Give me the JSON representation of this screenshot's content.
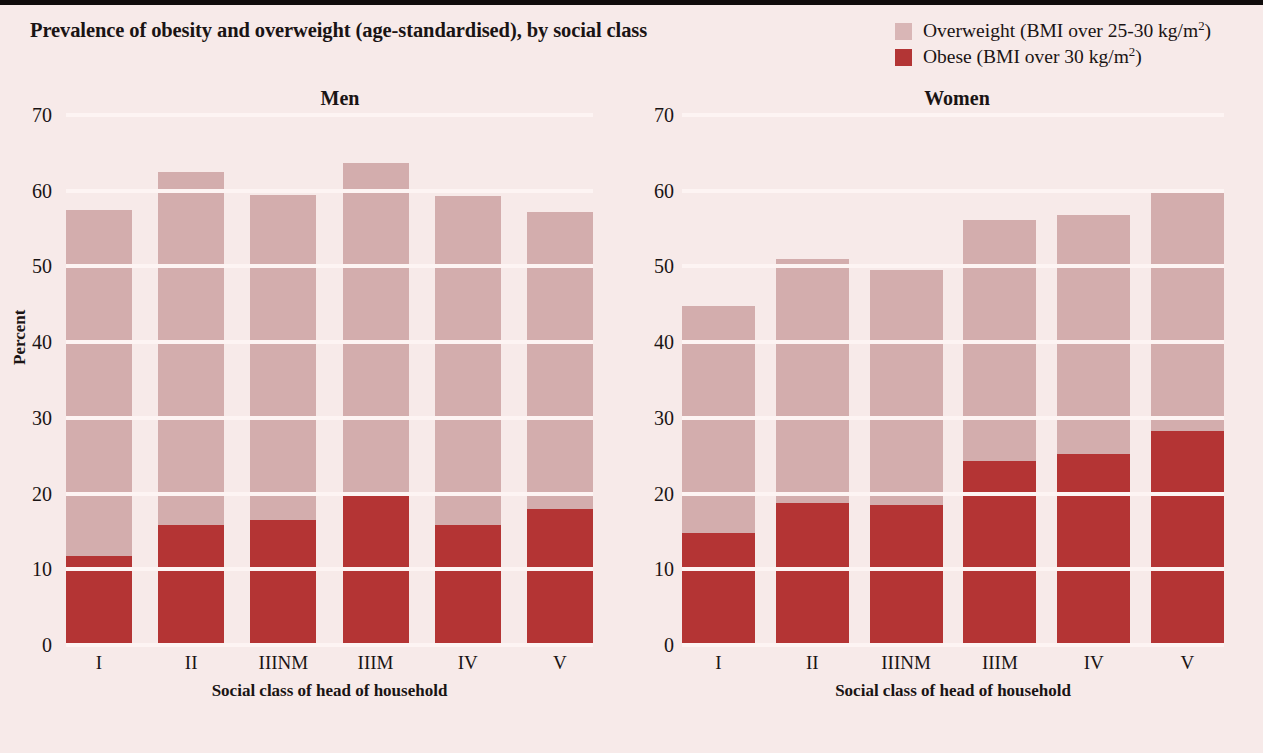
{
  "figure": {
    "title": "Prevalence of obesity and overweight (age-standardised), by social class"
  },
  "legend": {
    "position": "top-right",
    "items": [
      {
        "label_main": "Overweight (BMI over 25-30 kg/m",
        "sup": "2",
        "label_tail": ")",
        "color": "#d3adad",
        "key": "overweight"
      },
      {
        "label_main": "Obese (BMI over 30 kg/m",
        "sup": "2",
        "label_tail": ")",
        "color": "#b43434",
        "key": "obese"
      }
    ]
  },
  "chart_data": [
    {
      "type": "bar",
      "stacked": true,
      "title": "Men",
      "xlabel": "Social class of head of household",
      "ylabel": "Percent",
      "ylim": [
        0,
        70
      ],
      "yticks": [
        0,
        10,
        20,
        30,
        40,
        50,
        60,
        70
      ],
      "grid": true,
      "legend_position": "figure-top-right",
      "categories": [
        "I",
        "II",
        "IIINM",
        "IIIM",
        "IV",
        "V"
      ],
      "series": [
        {
          "name": "Obese (BMI over 30 kg/m2)",
          "color": "#b43434",
          "values": [
            11.7,
            15.8,
            16.5,
            19.7,
            15.9,
            17.9
          ]
        },
        {
          "name": "Overweight (BMI over 25-30 kg/m2)",
          "color": "#d3adad",
          "values": [
            45.8,
            46.7,
            43.0,
            44.0,
            43.4,
            39.3
          ]
        }
      ],
      "totals": [
        57.5,
        62.5,
        59.5,
        63.7,
        59.3,
        57.2
      ]
    },
    {
      "type": "bar",
      "stacked": true,
      "title": "Women",
      "xlabel": "Social class of head of household",
      "ylabel": "Percent",
      "ylim": [
        0,
        70
      ],
      "yticks": [
        0,
        10,
        20,
        30,
        40,
        50,
        60,
        70
      ],
      "grid": true,
      "legend_position": "figure-top-right",
      "categories": [
        "I",
        "II",
        "IIINM",
        "IIIM",
        "IV",
        "V"
      ],
      "series": [
        {
          "name": "Obese (BMI over 30 kg/m2)",
          "color": "#b43434",
          "values": [
            14.8,
            18.8,
            18.5,
            24.3,
            25.2,
            28.3
          ]
        },
        {
          "name": "Overweight (BMI over 25-30 kg/m2)",
          "color": "#d3adad",
          "values": [
            30.0,
            32.2,
            31.0,
            31.8,
            31.6,
            31.7
          ]
        }
      ],
      "totals": [
        44.8,
        51.0,
        49.5,
        56.1,
        56.8,
        60.0
      ]
    }
  ],
  "colors": {
    "background": "#f7eae9",
    "overweight": "#d3adad",
    "obese": "#b43434",
    "gridline": "#fdf4f3",
    "text": "#1a1414",
    "top_rule": "#100c0c"
  }
}
